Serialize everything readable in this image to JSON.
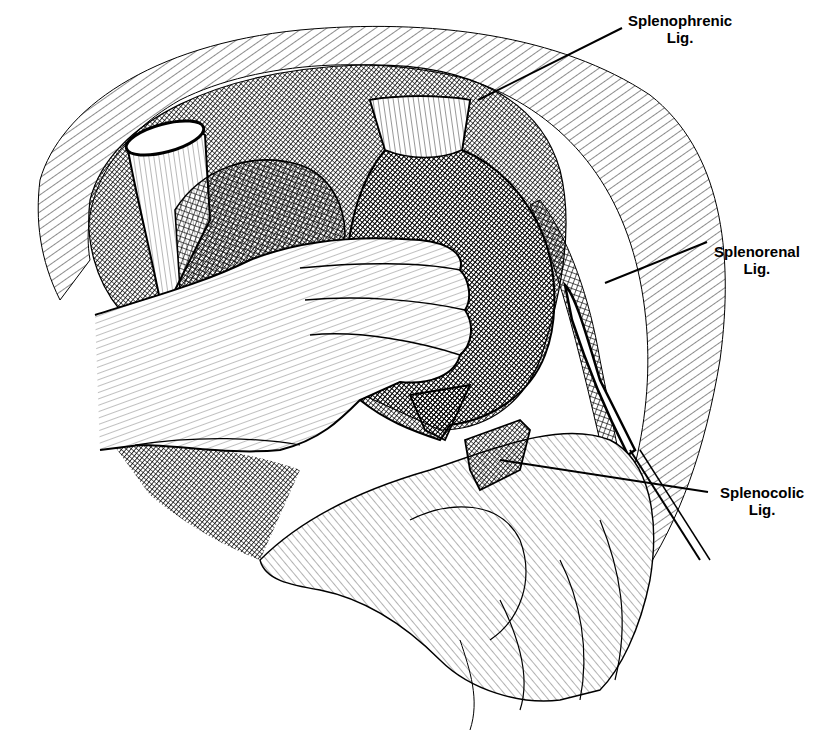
{
  "illustration": {
    "subject": "Hand mobilizing the spleen with ligaments labeled",
    "colors": {
      "ink": "#000000",
      "paper": "#ffffff"
    }
  },
  "labels": [
    {
      "id": "splenophrenic",
      "line1": "Splenophrenic",
      "line2": "Lig."
    },
    {
      "id": "splenorenal",
      "line1": "Splenorenal",
      "line2": "Lig."
    },
    {
      "id": "splenocolic",
      "line1": "Splenocolic",
      "line2": "Lig."
    }
  ]
}
